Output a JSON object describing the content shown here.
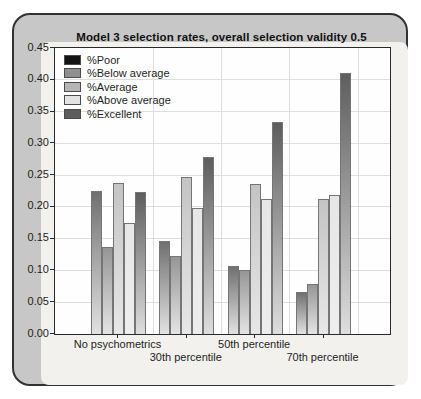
{
  "chart_data": {
    "type": "bar",
    "title": "Model 3 selection rates, overall selection validity 0.5",
    "categories": [
      "No psychometrics",
      "30th percentile",
      "50th percentile",
      "70th percentile"
    ],
    "series": [
      {
        "name": "%Poor",
        "legend_color": "#141414",
        "bar_top": "#707070",
        "bar_bottom": "#e2e2e2",
        "values": [
          0.225,
          0.147,
          0.107,
          0.066
        ]
      },
      {
        "name": "%Below average",
        "legend_color": "#8f8f8f",
        "bar_top": "#969696",
        "bar_bottom": "#e4e4e4",
        "values": [
          0.137,
          0.123,
          0.101,
          0.078
        ]
      },
      {
        "name": "%Average",
        "legend_color": "#b5b5b5",
        "bar_top": "#c4c4c4",
        "bar_bottom": "#e7e7e7",
        "values": [
          0.237,
          0.247,
          0.236,
          0.212
        ]
      },
      {
        "name": "%Above average",
        "legend_color": "#e3e3e3",
        "bar_top": "#e6e6e6",
        "bar_bottom": "#eeeeee",
        "values": [
          0.175,
          0.198,
          0.212,
          0.219
        ]
      },
      {
        "name": "%Excellent",
        "legend_color": "#5d5d5d",
        "bar_top": "#5e5e5e",
        "bar_bottom": "#dedede",
        "values": [
          0.224,
          0.279,
          0.333,
          0.41
        ]
      }
    ],
    "ylim": [
      0,
      0.45
    ],
    "ytick_step": 0.05,
    "ytick_labels": [
      "0.00",
      "0.05",
      "0.10",
      "0.15",
      "0.20",
      "0.25",
      "0.30",
      "0.35",
      "0.40",
      "0.45"
    ],
    "grid": "horizontal lines at each y tick, vertical lines at group boundaries",
    "legend_position": "top-left inside plot",
    "xlabel": "",
    "ylabel": ""
  },
  "colors": {
    "page_background": "#ffffff",
    "card_background": "#c7c7c7",
    "card_border": "#323232",
    "panel_background": "#f2f1ee",
    "plot_background": "#fefefe",
    "axis": "#2a2a2a",
    "gridline": "#dedede"
  }
}
